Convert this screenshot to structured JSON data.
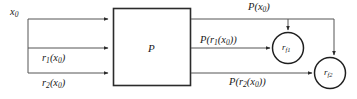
{
  "figure": {
    "type": "block-diagram",
    "title": "",
    "background_color": "#ffffff",
    "line_color": "#3a3a3a",
    "text_color": "#1a1a1a"
  },
  "block": {
    "name": "processing-block",
    "label": "P",
    "x": 113,
    "y": 8,
    "width": 78,
    "height": 78
  },
  "inputs": [
    {
      "name": "input-x0",
      "label_html": "x<span class=\"sub\">0</span>",
      "label_text": "x0",
      "row_y": 19,
      "label_x": 10,
      "label_y": 8
    },
    {
      "name": "input-r1-x0",
      "label_html": "r<span class=\"sub\">1</span>(x<span class=\"sub\">0</span>)",
      "label_text": "r1(x0)",
      "row_y": 48,
      "label_x": 42,
      "label_y": 54
    },
    {
      "name": "input-r2-x0",
      "label_html": "r<span class=\"sub\">2</span>(x<span class=\"sub\">0</span>)",
      "label_text": "r2(x0)",
      "row_y": 73,
      "label_x": 42,
      "label_y": 79
    }
  ],
  "outputs": [
    {
      "name": "output-p-x0",
      "label_html": "P(x<span class=\"sub\">0</span>)",
      "label_text": "P(x0)",
      "row_y": 19,
      "label_x": 248,
      "label_y": 3
    },
    {
      "name": "output-p-r1-x0",
      "label_html": "P(r<span class=\"sub\">1</span>(x<span class=\"sub\">0</span>))",
      "label_text": "P(r1(x0))",
      "row_y": 48,
      "label_x": 200,
      "label_y": 36
    },
    {
      "name": "output-p-r2-x0",
      "label_html": "P(r<span class=\"sub\">2</span>(x<span class=\"sub\">0</span>))",
      "label_text": "P(r2(x0))",
      "row_y": 73,
      "label_x": 229,
      "label_y": 78
    }
  ],
  "nodes": [
    {
      "name": "node-rf1",
      "label_html": "r<span class=\"sub\">f1</span>",
      "label_text": "rf1",
      "cx": 288,
      "cy": 48,
      "r": 16
    },
    {
      "name": "node-rf2",
      "label_html": "r<span class=\"sub\">f2</span>",
      "label_text": "rf2",
      "cx": 330,
      "cy": 73,
      "r": 16
    }
  ],
  "connections": [
    {
      "name": "wire-x0-to-block",
      "from": "x0",
      "to": "block-input-1"
    },
    {
      "name": "wire-x0-bus-down",
      "from": "x0",
      "to": "input-bus"
    },
    {
      "name": "wire-r1-to-block",
      "from": "input-bus",
      "to": "block-input-2"
    },
    {
      "name": "wire-r2-to-block",
      "from": "input-bus",
      "to": "block-input-3"
    },
    {
      "name": "wire-px0-to-rf1",
      "from": "block-output-1",
      "to": "node-rf1"
    },
    {
      "name": "wire-px0-to-rf2",
      "from": "block-output-1",
      "to": "node-rf2"
    },
    {
      "name": "wire-pr1-to-rf1",
      "from": "block-output-2",
      "to": "node-rf1"
    },
    {
      "name": "wire-pr2-to-rf2",
      "from": "block-output-3",
      "to": "node-rf2"
    }
  ]
}
